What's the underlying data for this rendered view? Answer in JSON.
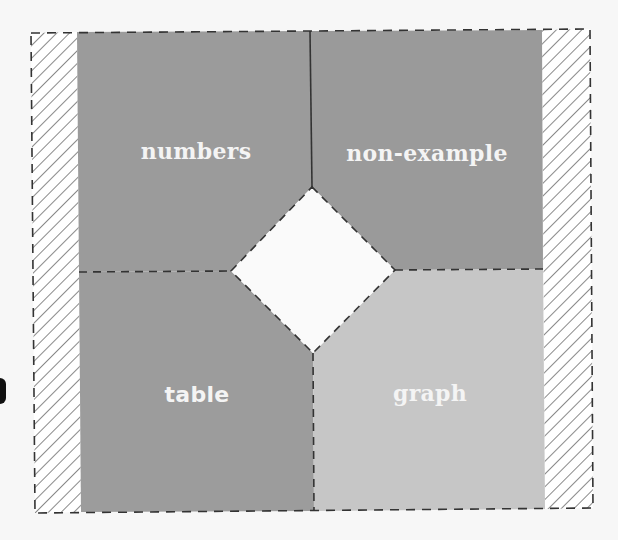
{
  "diagram": {
    "type": "frayer-model",
    "quadrants": [
      {
        "id": "top-left",
        "label": "numbers",
        "color": "#9b9b9b"
      },
      {
        "id": "top-right",
        "label": "non-example",
        "color": "#9a9a9a"
      },
      {
        "id": "bottom-left",
        "label": "table",
        "color": "#9c9c9c"
      },
      {
        "id": "bottom-right",
        "label": "graph",
        "color": "#c6c6c6"
      }
    ],
    "center": {
      "label": "",
      "color": "#fafafa"
    },
    "side_bands": {
      "pattern": "diagonal-hatch",
      "stroke": "#8a8a8a"
    },
    "border": {
      "style": "dashed",
      "color": "#3a3a3a"
    }
  }
}
